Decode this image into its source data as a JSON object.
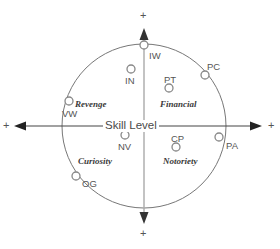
{
  "diagram": {
    "center_axis_label": "Skill Level",
    "plus_marks": {
      "left": "+",
      "right": "+",
      "top": "+",
      "bottom": "+"
    },
    "colors": {
      "circle_outline": "#777777",
      "h_axis": "#444444",
      "v_axis": "#aaaaaa",
      "marker_outline": "#888888",
      "marker_fill": "#ffffff",
      "point_label_text": "#555555",
      "quadrant_label_text": "#3a3a3a",
      "axis_label_text": "#4a4a4a",
      "background": "#ffffff"
    },
    "geometry": {
      "center_x": 144,
      "center_y": 126,
      "radius": 82
    },
    "quadrant_labels": [
      {
        "name": "Revenge",
        "x": 75,
        "y": 100
      },
      {
        "name": "Financial",
        "x": 160,
        "y": 100
      },
      {
        "name": "Curiosity",
        "x": 78,
        "y": 157
      },
      {
        "name": "Notoriety",
        "x": 163,
        "y": 157
      }
    ],
    "points": [
      {
        "code": "IW",
        "cx": 144,
        "cy": 45,
        "lx": 149,
        "ly": 51
      },
      {
        "code": "IN",
        "cx": 131,
        "cy": 69,
        "lx": 125,
        "ly": 76
      },
      {
        "code": "PT",
        "cx": 169,
        "cy": 88,
        "lx": 164,
        "ly": 75
      },
      {
        "code": "PC",
        "cx": 205,
        "cy": 75,
        "lx": 207,
        "ly": 62
      },
      {
        "code": "VW",
        "cx": 69,
        "cy": 101,
        "lx": 62,
        "ly": 109
      },
      {
        "code": "NV",
        "cx": 125,
        "cy": 135,
        "lx": 118,
        "ly": 142
      },
      {
        "code": "CP",
        "cx": 176,
        "cy": 147,
        "lx": 171,
        "ly": 134
      },
      {
        "code": "PA",
        "cx": 219,
        "cy": 137,
        "lx": 226,
        "ly": 141
      },
      {
        "code": "OG",
        "cx": 76,
        "cy": 176,
        "lx": 82,
        "ly": 179
      }
    ]
  }
}
